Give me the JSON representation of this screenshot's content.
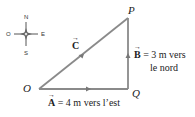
{
  "compass": {
    "north": "N",
    "south": "S",
    "east": "E",
    "west": "O"
  },
  "points": {
    "origin": "O",
    "corner": "Q",
    "apex": "P"
  },
  "vectors": {
    "a": {
      "symbol": "A",
      "text": "= 4 m vers l’est"
    },
    "b": {
      "symbol": "B",
      "text": "= 3 m vers",
      "text2": "le nord"
    },
    "c": {
      "symbol": "C"
    }
  },
  "colors": {
    "line": "#8a8a8a",
    "text": "#222222"
  }
}
